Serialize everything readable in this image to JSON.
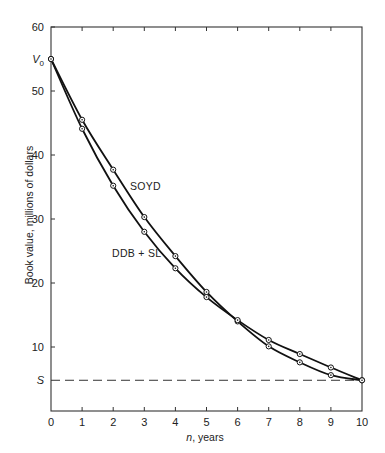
{
  "chart_data": {
    "type": "line",
    "title": "",
    "xlabel_italic": "n",
    "xlabel_rest": ", years",
    "xlabel": "n, years",
    "ylabel": "Book value, millions of dollars",
    "xlim": [
      0,
      10
    ],
    "ylim": [
      0,
      60
    ],
    "x_ticks": [
      0,
      1,
      2,
      3,
      4,
      5,
      6,
      7,
      8,
      9,
      10
    ],
    "y_ticks": [
      10,
      20,
      30,
      40,
      50,
      60
    ],
    "special_y_labels": [
      {
        "label": "V",
        "sub": "0",
        "value": 55
      },
      {
        "label": "S",
        "value": 4.8
      }
    ],
    "grid": false,
    "legend": "inline labels",
    "x": [
      0,
      1,
      2,
      3,
      4,
      5,
      6,
      7,
      8,
      9,
      10
    ],
    "series": [
      {
        "name": "SOYD",
        "values": [
          55,
          45.5,
          37.7,
          30.3,
          24.2,
          18.6,
          14.0,
          10.1,
          7.6,
          5.6,
          4.8
        ],
        "label_pos": {
          "x": 130,
          "y": 190
        }
      },
      {
        "name": "DDB + SL",
        "values": [
          55,
          44.1,
          35.2,
          28.0,
          22.3,
          17.8,
          14.2,
          11.1,
          8.9,
          6.8,
          4.8
        ],
        "label_pos": {
          "x": 112,
          "y": 257
        }
      }
    ],
    "salvage_line": {
      "label": "S",
      "value": 4.8,
      "style": "dashed"
    }
  }
}
